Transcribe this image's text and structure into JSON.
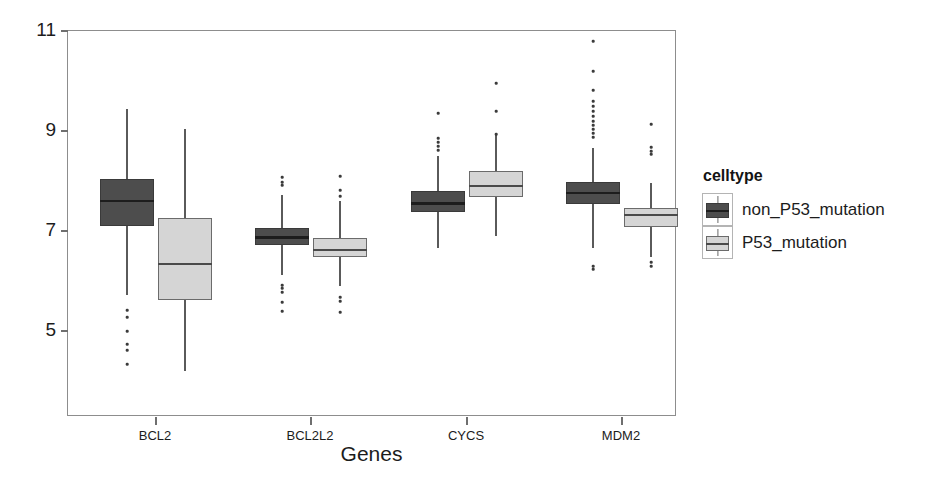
{
  "chart_data": {
    "type": "box",
    "title": "",
    "xlabel": "Genes",
    "ylabel": "",
    "ylim": [
      4.0,
      11.4
    ],
    "yticks": [
      11,
      9,
      7,
      5
    ],
    "ytick_labels": [
      "11",
      "9",
      "7",
      "5"
    ],
    "grid": false,
    "categories": [
      "BCL2",
      "BCL2L2",
      "CYCS",
      "MDM2"
    ],
    "legend": {
      "title": "celltype",
      "position": "right",
      "entries": [
        {
          "label": "non_P53_mutation",
          "color": "#4d4d4d"
        },
        {
          "label": "P53_mutation",
          "color": "#d5d5d5"
        }
      ]
    },
    "series": [
      {
        "name": "non_P53_mutation",
        "color": "#4d4d4d",
        "boxes": [
          {
            "category": "BCL2",
            "q1": 7.1,
            "median": 7.6,
            "q3": 8.05,
            "whisker_low": 5.72,
            "whisker_high": 9.45,
            "outliers": [
              5.42,
              5.28,
              5.0,
              4.74,
              4.62,
              4.34
            ]
          },
          {
            "category": "BCL2L2",
            "q1": 6.72,
            "median": 6.87,
            "q3": 7.06,
            "whisker_low": 6.12,
            "whisker_high": 7.72,
            "outliers": [
              8.08,
              7.98,
              7.92,
              5.92,
              5.86,
              5.78,
              5.58,
              5.4
            ]
          },
          {
            "category": "CYCS",
            "q1": 7.38,
            "median": 7.55,
            "q3": 7.81,
            "whisker_low": 6.66,
            "whisker_high": 8.5,
            "outliers": [
              9.36,
              8.86,
              8.78,
              8.7,
              8.62
            ]
          },
          {
            "category": "MDM2",
            "q1": 7.55,
            "median": 7.76,
            "q3": 7.98,
            "whisker_low": 6.66,
            "whisker_high": 8.66,
            "outliers": [
              10.8,
              10.2,
              9.82,
              9.6,
              9.5,
              9.4,
              9.3,
              9.2,
              9.12,
              9.04,
              8.96,
              8.88,
              6.3,
              6.24
            ]
          }
        ]
      },
      {
        "name": "P53_mutation",
        "color": "#d5d5d5",
        "boxes": [
          {
            "category": "BCL2",
            "q1": 5.63,
            "median": 6.34,
            "q3": 7.26,
            "whisker_low": 4.2,
            "whisker_high": 9.04,
            "outliers": []
          },
          {
            "category": "BCL2L2",
            "q1": 6.48,
            "median": 6.62,
            "q3": 6.86,
            "whisker_low": 5.9,
            "whisker_high": 7.6,
            "outliers": [
              8.1,
              7.82,
              7.7,
              5.68,
              5.6,
              5.38
            ]
          },
          {
            "category": "CYCS",
            "q1": 7.68,
            "median": 7.9,
            "q3": 8.2,
            "whisker_low": 6.9,
            "whisker_high": 8.92,
            "outliers": [
              9.96,
              9.4,
              8.94
            ]
          },
          {
            "category": "MDM2",
            "q1": 7.08,
            "median": 7.32,
            "q3": 7.46,
            "whisker_low": 6.48,
            "whisker_high": 7.96,
            "outliers": [
              9.14,
              8.68,
              8.6,
              8.54,
              6.38,
              6.3
            ]
          }
        ]
      }
    ]
  },
  "axis_geometry": {
    "plot_left": 67,
    "plot_right": 676,
    "plot_top": 30,
    "plot_bottom": 416,
    "y_of_11": 30,
    "y_of_5": 330,
    "category_centers": [
      155,
      310,
      466,
      621
    ],
    "box_half_width": 27,
    "box_offset": 29
  }
}
